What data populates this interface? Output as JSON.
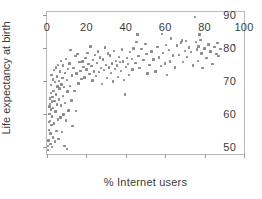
{
  "chart_data": {
    "type": "scatter",
    "title": "",
    "xlabel": "% Internet users",
    "ylabel": "Life expectancy at birth",
    "xlim": [
      0,
      100
    ],
    "ylim": [
      48,
      91
    ],
    "xticks": [
      0,
      20,
      40,
      60,
      80,
      100
    ],
    "yticks": [
      50,
      60,
      70,
      80,
      90
    ],
    "xtick_labels": [
      "0",
      "20",
      "40",
      "60",
      "80",
      "100"
    ],
    "ytick_labels": [
      "50",
      "60",
      "70",
      "80",
      "90"
    ],
    "grid": false,
    "legend": null,
    "marker": {
      "shape": "square",
      "color": "#8a8a8a",
      "size": 2.4
    },
    "frame_color": "#b9b9b9",
    "background": "#ffffff",
    "n_points": 195,
    "points": [
      [
        0.4,
        49.2
      ],
      [
        0.6,
        50.4
      ],
      [
        0.8,
        52.1
      ],
      [
        1.0,
        55.3
      ],
      [
        1.1,
        57.6
      ],
      [
        1.2,
        60.2
      ],
      [
        1.3,
        62.4
      ],
      [
        1.4,
        63.1
      ],
      [
        1.5,
        64.8
      ],
      [
        1.6,
        58.0
      ],
      [
        1.7,
        54.2
      ],
      [
        1.8,
        51.0
      ],
      [
        1.9,
        66.4
      ],
      [
        2.0,
        68.9
      ],
      [
        2.1,
        61.5
      ],
      [
        2.2,
        56.7
      ],
      [
        2.3,
        72.0
      ],
      [
        2.4,
        63.9
      ],
      [
        2.5,
        50.1
      ],
      [
        2.6,
        59.4
      ],
      [
        2.8,
        65.2
      ],
      [
        3.0,
        70.6
      ],
      [
        3.1,
        53.0
      ],
      [
        3.2,
        62.0
      ],
      [
        3.3,
        67.1
      ],
      [
        3.5,
        73.4
      ],
      [
        3.6,
        57.2
      ],
      [
        3.8,
        64.0
      ],
      [
        4.0,
        69.8
      ],
      [
        4.1,
        51.8
      ],
      [
        4.3,
        60.9
      ],
      [
        4.5,
        66.0
      ],
      [
        4.6,
        74.2
      ],
      [
        4.8,
        55.0
      ],
      [
        5.0,
        71.5
      ],
      [
        5.1,
        63.0
      ],
      [
        5.3,
        68.4
      ],
      [
        5.5,
        58.5
      ],
      [
        5.6,
        75.0
      ],
      [
        5.8,
        52.6
      ],
      [
        6.0,
        70.1
      ],
      [
        6.2,
        64.5
      ],
      [
        6.4,
        67.8
      ],
      [
        6.6,
        73.0
      ],
      [
        6.8,
        59.0
      ],
      [
        7.0,
        76.2
      ],
      [
        7.2,
        62.7
      ],
      [
        7.4,
        69.0
      ],
      [
        7.6,
        54.6
      ],
      [
        7.8,
        71.0
      ],
      [
        8.0,
        65.6
      ],
      [
        8.2,
        74.8
      ],
      [
        8.4,
        60.0
      ],
      [
        8.6,
        68.2
      ],
      [
        8.8,
        50.5
      ],
      [
        9.0,
        72.6
      ],
      [
        9.2,
        63.4
      ],
      [
        9.5,
        76.8
      ],
      [
        9.8,
        58.2
      ],
      [
        10.0,
        70.4
      ],
      [
        10.2,
        49.6
      ],
      [
        10.5,
        66.9
      ],
      [
        10.8,
        73.8
      ],
      [
        11.0,
        61.2
      ],
      [
        11.4,
        75.4
      ],
      [
        11.8,
        68.6
      ],
      [
        12.0,
        79.4
      ],
      [
        12.4,
        64.2
      ],
      [
        12.8,
        71.8
      ],
      [
        13.0,
        56.4
      ],
      [
        13.5,
        74.0
      ],
      [
        14.0,
        67.0
      ],
      [
        14.4,
        77.6
      ],
      [
        14.8,
        61.0
      ],
      [
        15.0,
        72.4
      ],
      [
        15.5,
        78.2
      ],
      [
        16.0,
        69.4
      ],
      [
        16.5,
        75.8
      ],
      [
        17.0,
        73.2
      ],
      [
        17.5,
        70.8
      ],
      [
        18.0,
        76.0
      ],
      [
        18.5,
        74.4
      ],
      [
        19.0,
        71.2
      ],
      [
        19.5,
        77.0
      ],
      [
        20.0,
        73.6
      ],
      [
        20.5,
        78.6
      ],
      [
        21.0,
        75.2
      ],
      [
        21.5,
        72.2
      ],
      [
        22.0,
        80.6
      ],
      [
        22.5,
        74.6
      ],
      [
        23.0,
        70.2
      ],
      [
        23.5,
        76.4
      ],
      [
        24.0,
        73.0
      ],
      [
        24.5,
        78.0
      ],
      [
        25.0,
        71.6
      ],
      [
        25.5,
        75.6
      ],
      [
        26.0,
        79.0
      ],
      [
        26.5,
        72.8
      ],
      [
        27.0,
        77.2
      ],
      [
        27.5,
        74.0
      ],
      [
        28.0,
        69.2
      ],
      [
        28.5,
        76.6
      ],
      [
        29.0,
        73.4
      ],
      [
        29.5,
        80.2
      ],
      [
        30.0,
        75.0
      ],
      [
        30.5,
        71.0
      ],
      [
        31.0,
        78.4
      ],
      [
        31.5,
        74.2
      ],
      [
        32.0,
        77.8
      ],
      [
        32.5,
        72.6
      ],
      [
        33.0,
        75.4
      ],
      [
        33.5,
        70.0
      ],
      [
        34.0,
        79.2
      ],
      [
        34.5,
        73.8
      ],
      [
        35.0,
        76.2
      ],
      [
        35.5,
        74.8
      ],
      [
        36.0,
        71.4
      ],
      [
        36.5,
        77.4
      ],
      [
        37.0,
        75.8
      ],
      [
        37.5,
        73.2
      ],
      [
        38.0,
        79.6
      ],
      [
        38.5,
        76.0
      ],
      [
        39.0,
        70.4
      ],
      [
        39.5,
        66.0
      ],
      [
        40.0,
        74.4
      ],
      [
        40.5,
        77.0
      ],
      [
        41.0,
        75.2
      ],
      [
        41.5,
        72.0
      ],
      [
        42.0,
        78.8
      ],
      [
        43.0,
        76.8
      ],
      [
        43.5,
        73.6
      ],
      [
        44.0,
        80.0
      ],
      [
        45.0,
        75.6
      ],
      [
        45.5,
        82.0
      ],
      [
        46.0,
        84.2
      ],
      [
        46.5,
        77.6
      ],
      [
        47.0,
        74.0
      ],
      [
        48.0,
        79.8
      ],
      [
        49.0,
        76.4
      ],
      [
        50.0,
        81.4
      ],
      [
        50.5,
        78.2
      ],
      [
        51.0,
        72.4
      ],
      [
        52.0,
        75.0
      ],
      [
        53.0,
        79.0
      ],
      [
        54.0,
        76.6
      ],
      [
        55.0,
        73.0
      ],
      [
        56.0,
        80.4
      ],
      [
        57.0,
        77.2
      ],
      [
        58.0,
        74.6
      ],
      [
        58.5,
        84.4
      ],
      [
        59.0,
        78.6
      ],
      [
        60.0,
        75.4
      ],
      [
        60.5,
        81.0
      ],
      [
        61.0,
        72.0
      ],
      [
        62.0,
        79.4
      ],
      [
        62.5,
        76.0
      ],
      [
        63.0,
        83.0
      ],
      [
        64.0,
        77.8
      ],
      [
        65.0,
        74.2
      ],
      [
        66.0,
        80.8
      ],
      [
        67.0,
        78.0
      ],
      [
        68.0,
        81.8
      ],
      [
        68.5,
        82.4
      ],
      [
        69.0,
        75.8
      ],
      [
        70.0,
        79.2
      ],
      [
        70.5,
        82.2
      ],
      [
        71.0,
        77.4
      ],
      [
        72.0,
        80.2
      ],
      [
        73.0,
        78.8
      ],
      [
        74.0,
        74.8
      ],
      [
        75.0,
        89.5
      ],
      [
        75.5,
        82.0
      ],
      [
        76.0,
        79.6
      ],
      [
        76.5,
        76.2
      ],
      [
        77.0,
        80.6
      ],
      [
        77.5,
        84.2
      ],
      [
        78.0,
        82.6
      ],
      [
        78.5,
        78.4
      ],
      [
        79.0,
        74.0
      ],
      [
        80.0,
        80.0
      ],
      [
        81.0,
        77.0
      ],
      [
        82.0,
        81.2
      ],
      [
        83.0,
        79.0
      ],
      [
        84.0,
        75.2
      ],
      [
        85.0,
        80.4
      ],
      [
        86.0,
        78.2
      ],
      [
        86.5,
        81.6
      ],
      [
        87.0,
        77.6
      ],
      [
        88.0,
        79.8
      ],
      [
        95.0,
        81.0
      ]
    ]
  }
}
